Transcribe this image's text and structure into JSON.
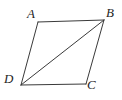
{
  "figure": {
    "kind": "geometry-diagram",
    "shape": "parallelogram",
    "background_color": "#ffffff",
    "stroke_color": "#3a3a3a",
    "label_color": "#252525",
    "stroke_width": 1,
    "viewbox": "0 0 122 100",
    "vertices": [
      {
        "name": "A",
        "label": "A",
        "x": 38,
        "y": 22,
        "label_x": 27,
        "label_y": 7
      },
      {
        "name": "B",
        "label": "B",
        "x": 104,
        "y": 20,
        "label_x": 106,
        "label_y": 6
      },
      {
        "name": "C",
        "label": "C",
        "x": 86,
        "y": 84,
        "label_x": 87,
        "label_y": 78
      },
      {
        "name": "D",
        "label": "D",
        "x": 21,
        "y": 85,
        "label_x": 4,
        "label_y": 72
      }
    ],
    "edges": [
      {
        "name": "edge-AB",
        "from": "A",
        "to": "B",
        "x1": 38,
        "y1": 22,
        "x2": 104,
        "y2": 20
      },
      {
        "name": "edge-BC",
        "from": "B",
        "to": "C",
        "x1": 104,
        "y1": 20,
        "x2": 86,
        "y2": 84
      },
      {
        "name": "edge-CD",
        "from": "C",
        "to": "D",
        "x1": 86,
        "y1": 84,
        "x2": 21,
        "y2": 85
      },
      {
        "name": "edge-DA",
        "from": "D",
        "to": "A",
        "x1": 21,
        "y1": 85,
        "x2": 38,
        "y2": 22
      }
    ],
    "diagonals": [
      {
        "name": "diagonal-DB",
        "from": "D",
        "to": "B",
        "x1": 21,
        "y1": 85,
        "x2": 104,
        "y2": 20
      }
    ],
    "labels": {
      "A": "A",
      "B": "B",
      "C": "C",
      "D": "D"
    }
  }
}
